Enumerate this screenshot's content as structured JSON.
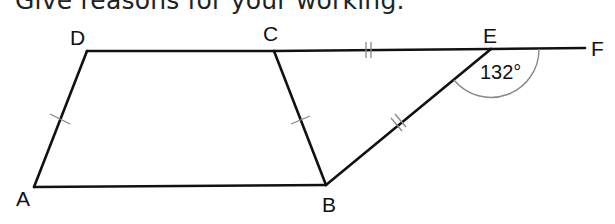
{
  "instruction": "Give reasons for your working.",
  "diagram": {
    "points": {
      "A": {
        "label": "A",
        "x": 34,
        "y": 187
      },
      "B": {
        "label": "B",
        "x": 326,
        "y": 185
      },
      "C": {
        "label": "C",
        "x": 274,
        "y": 51
      },
      "D": {
        "label": "D",
        "x": 87,
        "y": 51
      },
      "E": {
        "label": "E",
        "x": 491,
        "y": 49
      },
      "F": {
        "label": "F",
        "x": 585,
        "y": 48
      }
    },
    "segments": [
      "AB",
      "BC",
      "CD",
      "DA",
      "CE",
      "EF",
      "EB"
    ],
    "equal_marks": [
      {
        "segments": [
          "AD",
          "BC"
        ],
        "ticks": 1
      },
      {
        "segments": [
          "CE",
          "EB"
        ],
        "ticks": 2
      }
    ],
    "angle": {
      "vertex": "E",
      "between": [
        "F",
        "B"
      ],
      "label": "132°",
      "value": 132
    }
  }
}
